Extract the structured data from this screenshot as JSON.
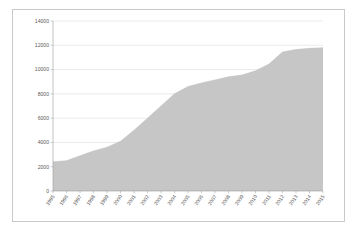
{
  "chart": {
    "title": "",
    "subtitle": "",
    "type": "area"
  },
  "chart_data": {
    "type": "area",
    "title": "",
    "xlabel": "",
    "ylabel": "",
    "categories": [
      "1995",
      "1996",
      "1997",
      "1998",
      "1999",
      "2000",
      "2001",
      "2002",
      "2003",
      "2004",
      "2005",
      "2006",
      "2007",
      "2008",
      "2009",
      "2010",
      "2011",
      "2012",
      "2013",
      "2014",
      "2015"
    ],
    "values": [
      2400,
      2500,
      2900,
      3300,
      3600,
      4100,
      5000,
      6000,
      7000,
      8000,
      8600,
      8900,
      9150,
      9400,
      9550,
      9900,
      10450,
      11450,
      11650,
      11750,
      11800
    ],
    "ylim": [
      0,
      14000
    ],
    "yticks": [
      0,
      2000,
      4000,
      6000,
      8000,
      10000,
      12000,
      14000
    ],
    "ytick_labels": [
      "0",
      "2000",
      "4000",
      "6000",
      "8000",
      "10000",
      "12000",
      "14000"
    ],
    "grid": true,
    "legend": false,
    "legend_position": "none",
    "series_color": "#c6c6c6",
    "gridline_color": "#d5d5d5",
    "axis_color": "#9a9a9a",
    "label_color": "#5a5a5a",
    "border_color": "#c9c9c9",
    "background": "#ffffff"
  }
}
